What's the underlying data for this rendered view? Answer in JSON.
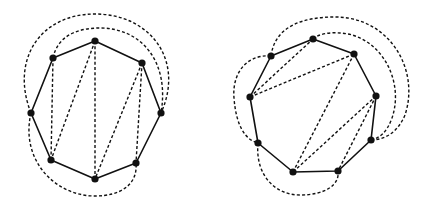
{
  "colors": {
    "background": "#ffffff",
    "ink": "#111111"
  },
  "diagrams": [
    {
      "name": "octagon-triangulation",
      "vertices": [
        {
          "id": "top",
          "x": 95,
          "y": 41
        },
        {
          "id": "upper-right",
          "x": 142,
          "y": 63
        },
        {
          "id": "right",
          "x": 161,
          "y": 113
        },
        {
          "id": "lower-right",
          "x": 136,
          "y": 163
        },
        {
          "id": "bottom",
          "x": 95,
          "y": 179
        },
        {
          "id": "lower-left",
          "x": 51,
          "y": 160
        },
        {
          "id": "left",
          "x": 31,
          "y": 113
        },
        {
          "id": "upper-left",
          "x": 53,
          "y": 58
        }
      ],
      "inner_chords": [
        [
          "upper-left",
          "lower-left"
        ],
        [
          "top",
          "lower-left"
        ],
        [
          "top",
          "bottom"
        ],
        [
          "upper-right",
          "bottom"
        ],
        [
          "upper-right",
          "lower-right"
        ]
      ],
      "outer_arcs": [
        {
          "from": "left",
          "to": "right",
          "path": "M31,113 C10,60 40,14 95,14 C150,14 185,60 161,113"
        },
        {
          "from": "upper-left",
          "to": "right",
          "path": "M53,58 C58,34 80,28 100,28 C140,28 170,60 161,113"
        },
        {
          "from": "left",
          "to": "lower-right",
          "path": "M31,113 C20,160 55,196 95,196 C120,196 138,185 136,163"
        }
      ]
    },
    {
      "name": "nonagon-triangulation",
      "vertices": [
        {
          "id": "top",
          "x": 313,
          "y": 39
        },
        {
          "id": "upper-right",
          "x": 354,
          "y": 54
        },
        {
          "id": "right",
          "x": 376,
          "y": 96
        },
        {
          "id": "lower-right",
          "x": 371,
          "y": 140
        },
        {
          "id": "bottom-right",
          "x": 338,
          "y": 171
        },
        {
          "id": "bottom-left",
          "x": 293,
          "y": 172
        },
        {
          "id": "lower-left",
          "x": 258,
          "y": 143
        },
        {
          "id": "left",
          "x": 250,
          "y": 97
        },
        {
          "id": "upper-left",
          "x": 271,
          "y": 56
        }
      ],
      "inner_chords": [
        [
          "left",
          "top"
        ],
        [
          "left",
          "upper-right"
        ],
        [
          "upper-right",
          "bottom-left"
        ],
        [
          "right",
          "bottom-left"
        ],
        [
          "right",
          "bottom-right"
        ]
      ],
      "outer_arcs": [
        {
          "from": "upper-left",
          "to": "lower-right",
          "path": "M271,56 C275,25 305,17 335,17 C390,17 420,70 405,115 C398,132 385,140 371,140"
        },
        {
          "from": "top",
          "to": "lower-right",
          "path": "M313,39 C318,34 330,32 340,33 C380,35 405,80 392,118 C387,132 380,138 371,140"
        },
        {
          "from": "upper-left",
          "to": "lower-left",
          "path": "M271,56 C245,54 232,75 234,98 C236,125 245,140 258,143"
        },
        {
          "from": "lower-left",
          "to": "bottom-right",
          "path": "M258,143 C255,175 275,195 300,195 C325,195 340,185 338,171"
        }
      ]
    }
  ]
}
